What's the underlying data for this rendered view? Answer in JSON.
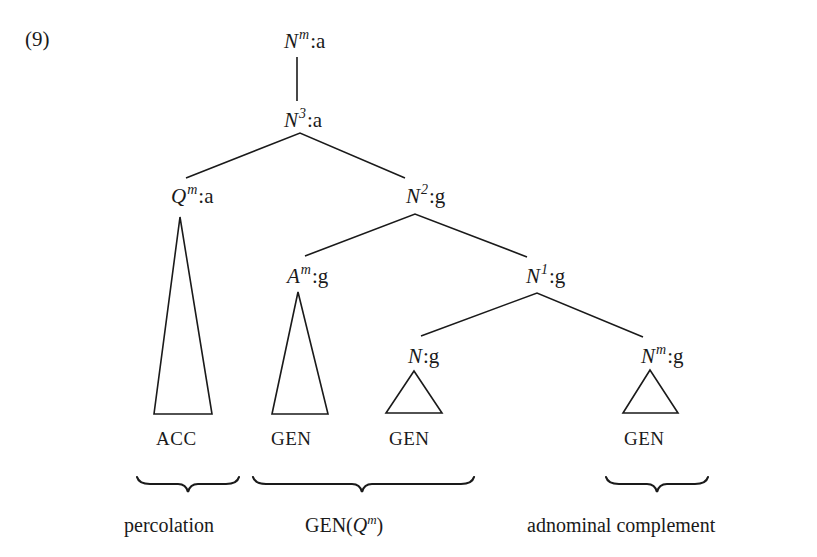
{
  "example_number": "(9)",
  "colors": {
    "ink": "#1a1a1a",
    "background": "#ffffff"
  },
  "tree": {
    "nodes": {
      "root": {
        "category": "N",
        "superscript": "m",
        "case": "a"
      },
      "n3": {
        "category": "N",
        "superscript": "3",
        "case": "a"
      },
      "qm": {
        "category": "Q",
        "superscript": "m",
        "case": "a"
      },
      "n2": {
        "category": "N",
        "superscript": "2",
        "case": "g"
      },
      "am": {
        "category": "A",
        "superscript": "m",
        "case": "g"
      },
      "n1": {
        "category": "N",
        "superscript": "1",
        "case": "g"
      },
      "n": {
        "category": "N",
        "superscript": "",
        "case": "g"
      },
      "nm": {
        "category": "N",
        "superscript": "m",
        "case": "g"
      }
    },
    "edges": [
      [
        "root",
        "n3"
      ],
      [
        "n3",
        "qm"
      ],
      [
        "n3",
        "n2"
      ],
      [
        "n2",
        "am"
      ],
      [
        "n2",
        "n1"
      ],
      [
        "n1",
        "n"
      ],
      [
        "n1",
        "nm"
      ]
    ],
    "separator": ":",
    "leaves": [
      {
        "under": "qm",
        "case_label": "ACC"
      },
      {
        "under": "am",
        "case_label": "GEN"
      },
      {
        "under": "n",
        "case_label": "GEN"
      },
      {
        "under": "nm",
        "case_label": "GEN"
      }
    ]
  },
  "annotations": [
    {
      "label": "percolation",
      "spans": [
        "ACC"
      ]
    },
    {
      "label_prefix": "GEN(",
      "label_category": "Q",
      "label_superscript": "m",
      "label_suffix": ")",
      "spans": [
        "GEN",
        "GEN"
      ]
    },
    {
      "label": "adnominal complement",
      "spans": [
        "GEN"
      ]
    }
  ]
}
